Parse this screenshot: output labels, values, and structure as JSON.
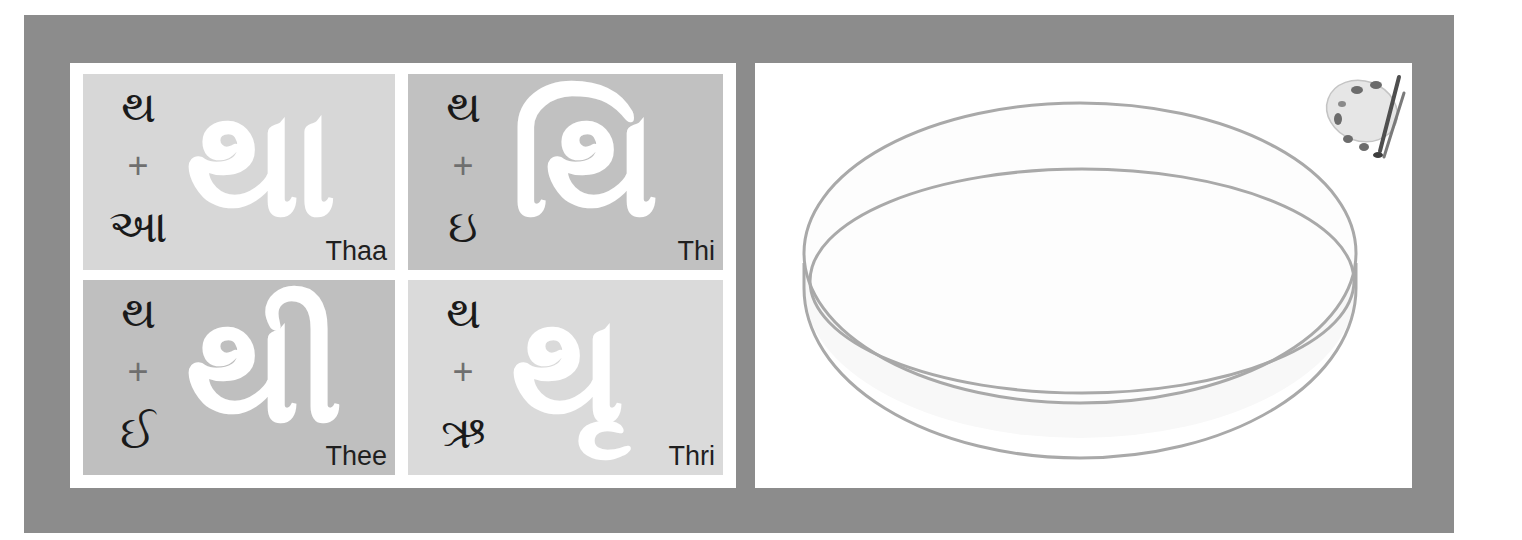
{
  "colors": {
    "frame": "#8c8c8c",
    "panel": "#ffffff",
    "tile_light": "#d7d7d7",
    "tile_mid": "#c1c1c1",
    "glyph_white": "#ffffff",
    "text_dark": "#1a1a1a",
    "plus_gray": "#6f6f6f",
    "dish_stroke": "#a9a9a9"
  },
  "tiles": [
    {
      "consonant": "થ",
      "plus": "+",
      "vowel": "આ",
      "result": "થા",
      "label": "Thaa",
      "shade": "light"
    },
    {
      "consonant": "થ",
      "plus": "+",
      "vowel": "ઇ",
      "result": "થિ",
      "label": "Thi",
      "shade": "mid"
    },
    {
      "consonant": "થ",
      "plus": "+",
      "vowel": "ઈ",
      "result": "થી",
      "label": "Thee",
      "shade": "mid"
    },
    {
      "consonant": "થ",
      "plus": "+",
      "vowel": "ઋ",
      "result": "થૃ",
      "label": "Thri",
      "shade": "light"
    }
  ],
  "right_panel": {
    "icons": [
      "paint-palette-icon",
      "paint-tray-illustration"
    ]
  }
}
